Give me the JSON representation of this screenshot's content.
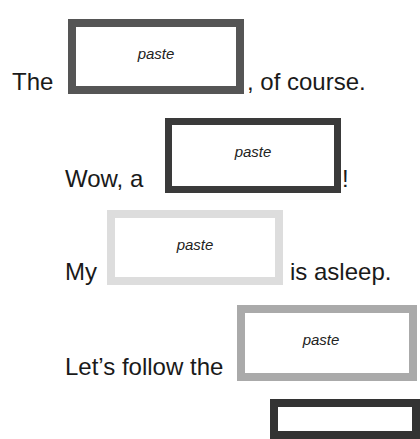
{
  "sentences": [
    {
      "before": "The",
      "after": ", of course.",
      "slot_label": "paste",
      "border_color": "#555555"
    },
    {
      "before": "Wow, a",
      "after": "!",
      "slot_label": "paste",
      "border_color": "#3a3a3a"
    },
    {
      "before": "My",
      "after": "is asleep.",
      "slot_label": "paste",
      "border_color": "#dddddd"
    },
    {
      "before": "Let’s follow the",
      "after": "",
      "slot_label": "paste",
      "border_color": "#aaaaaa"
    },
    {
      "before": "",
      "after": "",
      "slot_label": "",
      "border_color": "#333333"
    }
  ]
}
